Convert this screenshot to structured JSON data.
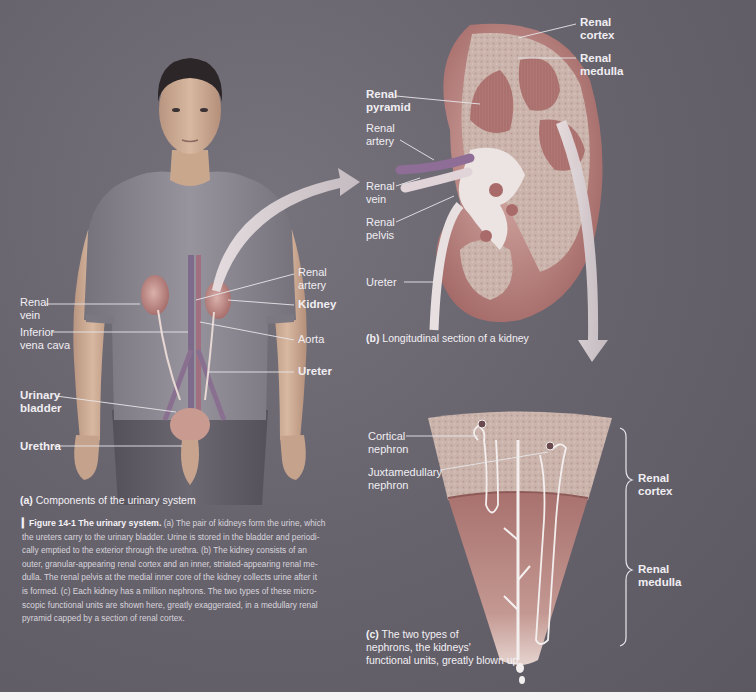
{
  "figure": {
    "number": "Figure 14-1",
    "title": "The urinary system.",
    "legend": "(a) The pair of kidneys form the urine, which the ureters carry to the urinary bladder. Urine is stored in the bladder and periodically emptied to the exterior through the urethra. (b) The kidney consists of an outer, granular-appearing renal cortex and an inner, striated-appearing renal medulla. The renal pelvis at the medial inner core of the kidney collects urine after it is formed. (c) Each kidney has a million nephrons. The two types of these microscopic functional units are shown here, greatly exaggerated, in a medullary renal pyramid capped by a section of renal cortex.",
    "legend_lines": [
      "(a) The pair of kidneys form the urine, which",
      "the ureters carry to the urinary bladder. Urine is stored in the bladder and periodi-",
      "cally emptied to the exterior through the urethra. (b) The kidney consists of an",
      "outer, granular-appearing renal cortex and an inner, striated-appearing renal me-",
      "dulla. The renal pelvis at the medial inner core of the kidney collects urine after it",
      "is formed. (c) Each kidney has a million nephrons. The two types of these micro-",
      "scopic functional units are shown here, greatly exaggerated, in a medullary renal",
      "pyramid capped by a section of renal cortex."
    ]
  },
  "panel_a": {
    "letter": "(a)",
    "caption": "Components of the urinary system",
    "labels": {
      "renal_vein": [
        "Renal",
        "vein"
      ],
      "inferior_vena_cava": [
        "Inferior",
        "vena cava"
      ],
      "urinary_bladder": [
        "Urinary",
        "bladder"
      ],
      "urethra": "Urethra",
      "renal_artery": [
        "Renal",
        "artery"
      ],
      "kidney": "Kidney",
      "aorta": "Aorta",
      "ureter": "Ureter"
    }
  },
  "panel_b": {
    "letter": "(b)",
    "caption": "Longitudinal section of a kidney",
    "labels": {
      "renal_cortex": [
        "Renal",
        "cortex"
      ],
      "renal_medulla": [
        "Renal",
        "medulla"
      ],
      "renal_pyramid": [
        "Renal",
        "pyramid"
      ],
      "renal_artery": [
        "Renal",
        "artery"
      ],
      "renal_vein": [
        "Renal",
        "vein"
      ],
      "renal_pelvis": [
        "Renal",
        "pelvis"
      ],
      "ureter": "Ureter"
    }
  },
  "panel_c": {
    "letter": "(c)",
    "caption_lines": [
      "The two types of",
      "nephrons, the kidneys'",
      "functional units, greatly blown up"
    ],
    "labels": {
      "cortical_nephron": [
        "Cortical",
        "nephron"
      ],
      "juxtamedullary_nephron": [
        "Juxtamedullary",
        "nephron"
      ],
      "renal_cortex": [
        "Renal",
        "cortex"
      ],
      "renal_medulla": [
        "Renal",
        "medulla"
      ]
    }
  },
  "colors": {
    "background": "#66626c",
    "skin": "#c9a78d",
    "shirt": "#8a8690",
    "pants": "#5d5963",
    "kidney": "#c48a86",
    "cortex": "#cdb8b0",
    "medulla": "#b77b78",
    "label_text": "#f0eef2",
    "leader_lines": "#e8e6ea"
  }
}
